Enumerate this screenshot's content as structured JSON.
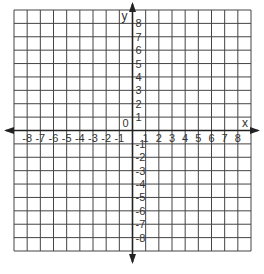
{
  "chart_data": {
    "type": "coordinate-grid",
    "title": "",
    "xlabel": "x",
    "ylabel": "y",
    "origin_label": "0",
    "xlim": [
      -9,
      9
    ],
    "ylim": [
      -9,
      9
    ],
    "grid": true,
    "x_ticks": [
      -8,
      -7,
      -6,
      -5,
      -4,
      -3,
      -2,
      -1,
      1,
      2,
      3,
      4,
      5,
      6,
      7,
      8
    ],
    "y_ticks": [
      -8,
      -7,
      -6,
      -5,
      -4,
      -3,
      -2,
      -1,
      1,
      2,
      3,
      4,
      5,
      6,
      7,
      8
    ],
    "x_tick_labels": [
      "-8",
      "-7",
      "-6",
      "-5",
      "-4",
      "-3",
      "-2",
      "-1",
      "1",
      "2",
      "3",
      "4",
      "5",
      "6",
      "7",
      "8"
    ],
    "y_tick_labels": [
      "-8",
      "-7",
      "-6",
      "-5",
      "-4",
      "-3",
      "-2",
      "-1",
      "1",
      "2",
      "3",
      "4",
      "5",
      "6",
      "7",
      "8"
    ],
    "series": []
  },
  "colors": {
    "grid": "#444444",
    "axis": "#222222",
    "text": "#333333",
    "background": "#ffffff"
  }
}
